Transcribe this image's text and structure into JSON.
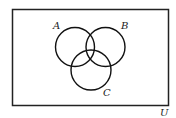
{
  "diagram": {
    "type": "venn",
    "universe_label": "U",
    "sets": [
      {
        "name": "A",
        "cx": 75,
        "cy": 47,
        "r": 19.5
      },
      {
        "name": "B",
        "cx": 105.5,
        "cy": 47,
        "r": 19.5
      },
      {
        "name": "C",
        "cx": 91,
        "cy": 70,
        "r": 20
      }
    ],
    "stroke_color": "#111111"
  }
}
